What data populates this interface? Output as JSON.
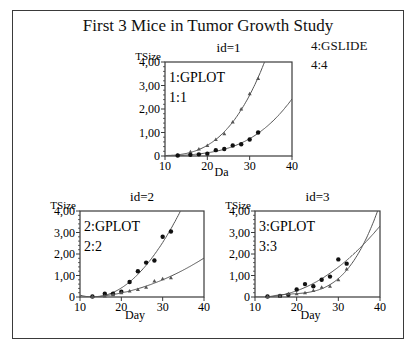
{
  "title": "First 3 Mice in Tumor Growth Study",
  "gslide": {
    "label": "4:GSLIDE",
    "index": "4:4"
  },
  "colors": {
    "frame": "#3a3a3a",
    "curve": "#555555",
    "marker": "#111111",
    "background": "#ffffff"
  },
  "chart_data": [
    {
      "type": "scatter",
      "title": "id=1",
      "panel_label": "1:GPLOT",
      "panel_index": "1:1",
      "xlabel": "Da",
      "ylabel": "TSize",
      "xlim": [
        10,
        40
      ],
      "ylim": [
        0,
        4
      ],
      "xticks": [
        "10",
        "20",
        "30",
        "40"
      ],
      "yticks": [
        "0",
        "1,00",
        "2,00",
        "3,00",
        "4,00"
      ],
      "series": [
        {
          "name": "group A (triangles)",
          "marker": "triangle",
          "x": [
            13,
            16,
            18,
            20,
            22,
            24,
            26,
            28,
            30,
            32
          ],
          "y": [
            0.03,
            0.18,
            0.3,
            0.45,
            0.7,
            0.95,
            1.45,
            2.0,
            2.65,
            3.3
          ],
          "fit": "quadratic-exponential"
        },
        {
          "name": "group B (dots)",
          "marker": "dot",
          "x": [
            13,
            16,
            18,
            20,
            22,
            24,
            26,
            28,
            30,
            32
          ],
          "y": [
            0.02,
            0.05,
            0.07,
            0.1,
            0.25,
            0.3,
            0.45,
            0.5,
            0.7,
            1.0
          ],
          "fit": "exponential"
        }
      ]
    },
    {
      "type": "scatter",
      "title": "id=2",
      "panel_label": "2:GPLOT",
      "panel_index": "2:2",
      "xlabel": "Day",
      "ylabel": "TSize",
      "xlim": [
        10,
        40
      ],
      "ylim": [
        0,
        4
      ],
      "xticks": [
        "10",
        "20",
        "30",
        "40"
      ],
      "yticks": [
        "0",
        "1,00",
        "2,00",
        "3,00",
        "4,00"
      ],
      "series": [
        {
          "name": "group A (dots)",
          "marker": "dot",
          "x": [
            13,
            16,
            18,
            20,
            22,
            24,
            26,
            28,
            30,
            32
          ],
          "y": [
            0.02,
            0.15,
            0.15,
            0.25,
            0.7,
            1.2,
            1.6,
            1.7,
            2.8,
            3.05
          ],
          "fit": "quadratic"
        },
        {
          "name": "group B (triangles)",
          "marker": "triangle",
          "x": [
            13,
            16,
            18,
            20,
            22,
            24,
            26,
            28,
            30,
            32
          ],
          "y": [
            0.02,
            0.05,
            0.1,
            0.2,
            0.28,
            0.35,
            0.45,
            0.75,
            0.85,
            0.9
          ],
          "fit": "quadratic"
        }
      ]
    },
    {
      "type": "scatter",
      "title": "id=3",
      "panel_label": "3:GPLOT",
      "panel_index": "3:3",
      "xlabel": "Day",
      "ylabel": "TSize",
      "xlim": [
        10,
        40
      ],
      "ylim": [
        0,
        4
      ],
      "xticks": [
        "10",
        "20",
        "30",
        "40"
      ],
      "yticks": [
        "0",
        "1,00",
        "2,00",
        "3,00",
        "4,00"
      ],
      "series": [
        {
          "name": "group A (dots)",
          "marker": "dot",
          "x": [
            13,
            16,
            18,
            20,
            22,
            24,
            26,
            28,
            30,
            32
          ],
          "y": [
            0.02,
            0.05,
            0.1,
            0.35,
            0.6,
            0.5,
            0.8,
            0.95,
            1.75,
            1.55
          ],
          "fit": "quadratic"
        },
        {
          "name": "group B (triangles)",
          "marker": "triangle",
          "x": [
            13,
            16,
            18,
            20,
            22,
            24,
            26,
            28,
            30,
            32
          ],
          "y": [
            0.02,
            0.03,
            0.15,
            0.15,
            0.2,
            0.3,
            0.45,
            0.5,
            0.8,
            1.3
          ],
          "fit": "exponential"
        }
      ]
    }
  ]
}
